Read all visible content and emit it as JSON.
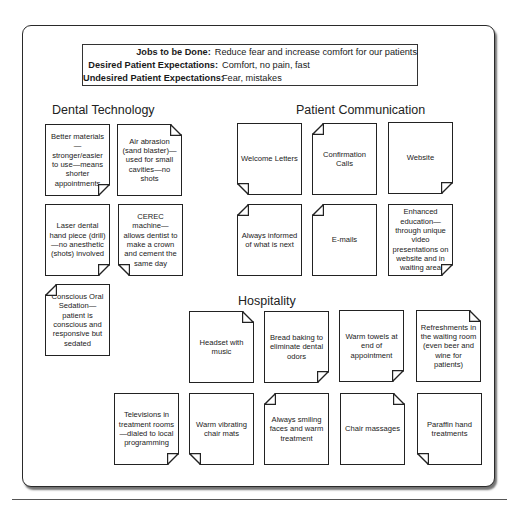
{
  "summary": {
    "rows": [
      {
        "label": "Jobs to be Done:",
        "value": "Reduce fear and increase comfort for our patients"
      },
      {
        "label": "Desired Patient Expectations:",
        "value": "Comfort, no pain, fast"
      },
      {
        "label": "Undesired Patient Expectations:",
        "value": "Fear, mistakes"
      }
    ]
  },
  "sections": {
    "dental_technology": {
      "title": "Dental Technology",
      "notes": [
        {
          "text": "Better materials—stronger/easier to use—means shorter appointments",
          "fold": "br"
        },
        {
          "text": "Air abrasion (sand blaster)—used for small cavities—no shots",
          "fold": "tr"
        },
        {
          "text": "Laser dental hand piece (drill)—no anesthetic (shots) involved",
          "fold": "br"
        },
        {
          "text": "CEREC machine—allows dentist to make a crown and cement the same day",
          "fold": "bl"
        },
        {
          "text": "Conscious Oral Sedation—patient is conscious and responsive but sedated",
          "fold": "tl"
        }
      ]
    },
    "patient_communication": {
      "title": "Patient Communication",
      "notes": [
        {
          "text": "Welcome Letters",
          "fold": "bl"
        },
        {
          "text": "Confirmation Calls",
          "fold": "tl"
        },
        {
          "text": "Website",
          "fold": "br"
        },
        {
          "text": "Always informed of what is next",
          "fold": "tl"
        },
        {
          "text": "E-mails",
          "fold": "tl"
        },
        {
          "text": "Enhanced education—through unique video presentations on website and in waiting area",
          "fold": "br"
        }
      ]
    },
    "hospitality": {
      "title": "Hospitality",
      "notes": [
        {
          "text": "Headset with music",
          "fold": "tr"
        },
        {
          "text": "Bread baking to eliminate dental odors",
          "fold": "br"
        },
        {
          "text": "Warm towels at end of appointment",
          "fold": "br"
        },
        {
          "text": "Refreshments in the waiting room (even beer and wine for patients)",
          "fold": "tr"
        },
        {
          "text": "Televisions in treatment rooms—dialed to local programming",
          "fold": "br"
        },
        {
          "text": "Warm vibrating chair mats",
          "fold": "bl"
        },
        {
          "text": "Always smiling faces and warm treatment",
          "fold": "tl"
        },
        {
          "text": "Chair massages",
          "fold": "tr"
        },
        {
          "text": "Paraffin hand treatments",
          "fold": "bl"
        }
      ]
    }
  }
}
